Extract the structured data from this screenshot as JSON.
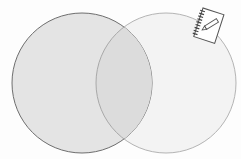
{
  "diagram": {
    "type": "venn",
    "sets": [
      {
        "name": "left-set",
        "fill": "#e4e4e4",
        "stroke": "#7a7a7a",
        "cx": 82,
        "cy": 83,
        "r": 70
      },
      {
        "name": "right-set",
        "fill": "#f3f3f3",
        "stroke": "#b0b0b0",
        "cx": 166,
        "cy": 83,
        "r": 70
      }
    ],
    "overlap_fill": "#dedede",
    "icon": "notebook-pencil-icon"
  }
}
